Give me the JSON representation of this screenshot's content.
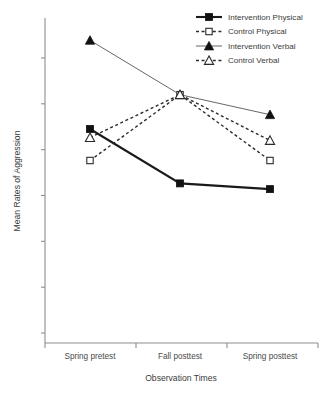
{
  "chart_data": {
    "type": "line",
    "title": "",
    "xlabel": "Observation Times",
    "ylabel": "Mean Rates of Aggression",
    "categories": [
      "Spring pretest",
      "Fall posttest",
      "Spring posttest"
    ],
    "ylim": [
      0,
      10
    ],
    "y_tick_labels": [],
    "y_tick_count": 7,
    "grid": false,
    "legend_position": "top-right",
    "series": [
      {
        "name": "Intervention Physical",
        "values": [
          6.4,
          4.5,
          4.3
        ],
        "marker": "filled-square",
        "line_style": "solid-thick",
        "color": "#111111"
      },
      {
        "name": "Control Physical",
        "values": [
          5.3,
          7.6,
          5.3
        ],
        "marker": "open-square",
        "line_style": "dashed",
        "color": "#2b2b2b"
      },
      {
        "name": "Intervention Verbal",
        "values": [
          9.5,
          7.6,
          6.9
        ],
        "marker": "filled-triangle",
        "line_style": "solid-thin",
        "color": "#555555"
      },
      {
        "name": "Control Verbal",
        "values": [
          6.1,
          7.6,
          6.0
        ],
        "marker": "open-triangle",
        "line_style": "dashed",
        "color": "#2b2b2b"
      }
    ]
  },
  "legend": {
    "items": [
      {
        "label": "Intervention Physical"
      },
      {
        "label": "Control Physical"
      },
      {
        "label": "Intervention Verbal"
      },
      {
        "label": "Control Verbal"
      }
    ]
  },
  "axes": {
    "x_title": "Observation Times",
    "y_title": "Mean Rates of Aggression",
    "x_categories": [
      "Spring pretest",
      "Fall posttest",
      "Spring posttest"
    ]
  }
}
